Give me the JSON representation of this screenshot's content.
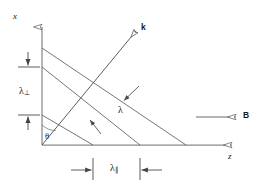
{
  "figure": {
    "type": "vector-wave-diagram",
    "background_color": "#ffffff",
    "line_color": "#555555",
    "text_color": "#1a1a1a"
  },
  "axes": {
    "vertical": {
      "label": "x",
      "origin_px": [
        42,
        145
      ],
      "tip_px": [
        42,
        22
      ]
    },
    "horizontal": {
      "label": "z",
      "origin_px": [
        42,
        145
      ],
      "tip_px": [
        237,
        145
      ]
    }
  },
  "vectors": [
    {
      "name": "wave-vector",
      "label": "k",
      "bold": true,
      "from_px": [
        42,
        145
      ],
      "to_px": [
        139,
        28
      ]
    },
    {
      "name": "magnetic-field-vector",
      "label": "B",
      "bold": true,
      "from_px": [
        196,
        117
      ],
      "to_px": [
        240,
        117
      ]
    }
  ],
  "angle": {
    "name": "theta",
    "label": "θ",
    "between": [
      "x-axis",
      "wave-vector"
    ],
    "vertex_px": [
      42,
      145
    ]
  },
  "wavefronts": {
    "count": 3,
    "lines": [
      {
        "from_px": [
          42,
          48
        ],
        "to_px": [
          186,
          145
        ]
      },
      {
        "from_px": [
          42,
          67
        ],
        "to_px": [
          140,
          145
        ]
      },
      {
        "from_px": [
          42,
          115
        ],
        "to_px": [
          93,
          145
        ]
      }
    ]
  },
  "dimensions": {
    "perpendicular": {
      "name": "lambda-perpendicular",
      "label": "λ",
      "subscript": "⊥",
      "orientation": "vertical",
      "from_px": [
        28,
        67
      ],
      "to_px": [
        28,
        115
      ]
    },
    "parallel": {
      "name": "lambda-parallel",
      "label": "λ",
      "subscript": "∥",
      "orientation": "horizontal",
      "from_px": [
        93,
        170
      ],
      "to_px": [
        140,
        170
      ]
    },
    "wavelength": {
      "name": "lambda",
      "label": "λ",
      "subscript": "",
      "orientation": "perpendicular-to-wavefront",
      "arrows": [
        {
          "from_px": [
            138,
            88
          ],
          "to_px": [
            122,
            103
          ]
        },
        {
          "from_px": [
            100,
            133
          ],
          "to_px": [
            88,
            118
          ]
        }
      ]
    }
  },
  "labels": {
    "x_axis": "x",
    "z_axis": "z",
    "k_vector": "k",
    "b_vector": "B",
    "theta": "θ",
    "lambda": "λ",
    "lambda_perp_sub": "⊥",
    "lambda_par_sub": "∥"
  }
}
